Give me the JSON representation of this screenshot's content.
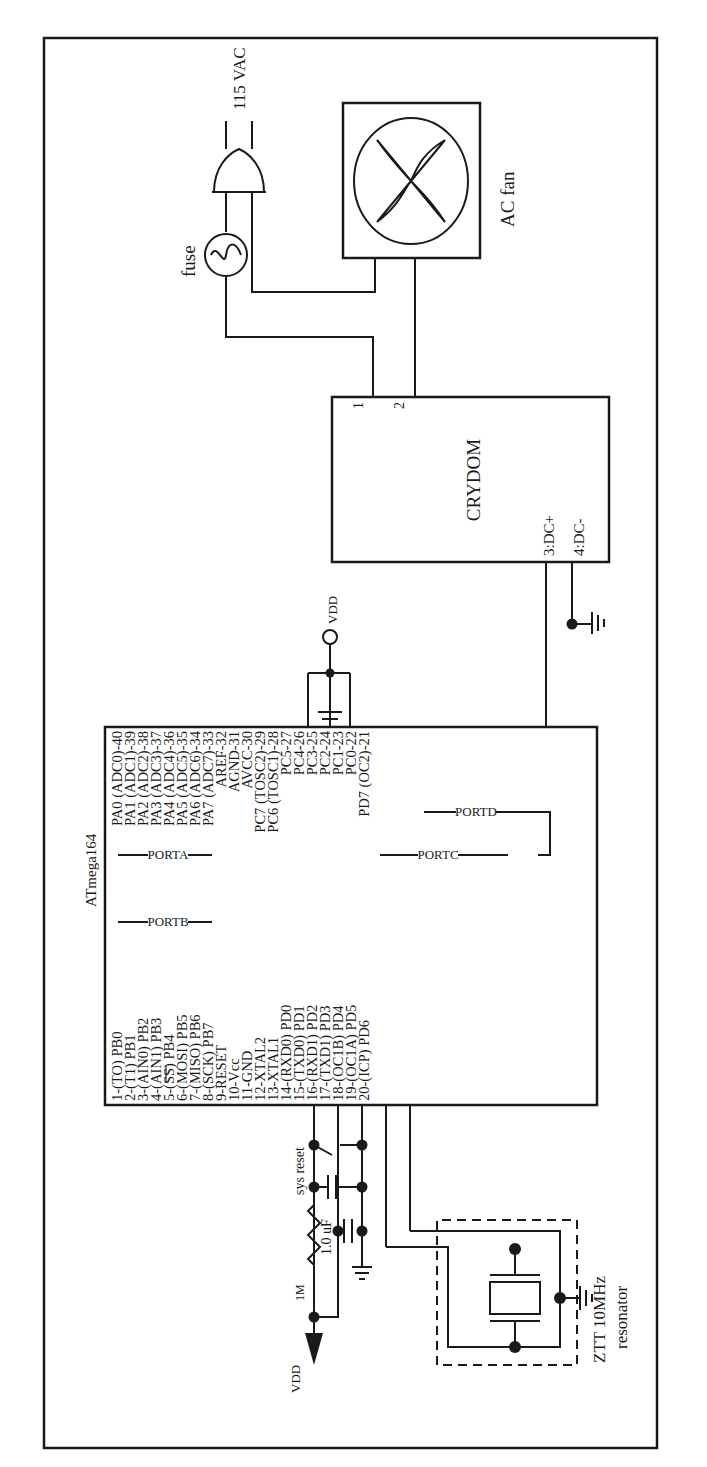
{
  "colors": {
    "ink": "#1a1a1a",
    "background": "#ffffff"
  },
  "power": {
    "mains_label": "115 VAC",
    "fuse_label": "fuse",
    "vdd_top": "VDD",
    "vdd_bottom": "VDD"
  },
  "fan": {
    "label": "AC fan"
  },
  "ssr": {
    "name": "CRYDOM",
    "pin1": "1",
    "pin2": "2",
    "pin3": "3:DC+",
    "pin4": "4:DC-"
  },
  "mcu": {
    "name": "ATmega164",
    "ports": {
      "a": "PORTA",
      "b": "PORTB",
      "c": "PORTC",
      "d": "PORTD"
    },
    "left_pins": [
      "1-(TO) PB0",
      "2-(T1) PB1",
      "3-(AIN0) PB2",
      "4-(AIN1) PB3",
      "5-(SS) PB4",
      "6-(MOSI) PB5",
      "7-(MISO) PB6",
      "8-(SCK) PB7",
      "9-RESET",
      "10-Vcc",
      "11-GND",
      "12-XTAL2",
      "13-XTAL1",
      "14-(RXD0) PD0",
      "15-(TXD0) PD1",
      "16-(RXD1) PD2",
      "17-(TXD1) PD3",
      "18-(OC1B) PD4",
      "19-(OC1A) PD5",
      "20-(ICP) PD6"
    ],
    "right_pins": [
      "PA0 (ADC0)-40",
      "PA1 (ADC1)-39",
      "PA2 (ADC2)-38",
      "PA3 (ADC3)-37",
      "PA4 (ADC4)-36",
      "PA5 (ADC5)-35",
      "PA6 (ADC6)-34",
      "PA7 (ADC7)-33",
      "AREF-32",
      "AGND-31",
      "AVCC-30",
      "PC7 (TOSC2)-29",
      "PC6 (TOSC1)-28",
      "PC5-27",
      "PC4-26",
      "PC3-25",
      "PC2-24",
      "PC1-23",
      "PC0-22",
      "PD7 (OC2)-21"
    ]
  },
  "reset_circuit": {
    "switch_label": "sys reset",
    "cap_label": "1.0 uF",
    "resistor_label": "1M"
  },
  "resonator": {
    "line1": "ZTT 10MHz",
    "line2": "resonator"
  }
}
